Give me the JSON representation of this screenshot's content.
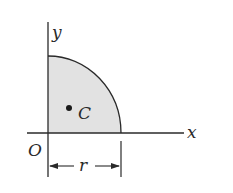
{
  "diagram": {
    "labels": {
      "x_axis": "x",
      "y_axis": "y",
      "origin": "O",
      "centroid": "C",
      "radius": "r"
    },
    "colors": {
      "fill": "#e2e2e2",
      "stroke": "#2a2a2a",
      "background": "#ffffff"
    }
  }
}
